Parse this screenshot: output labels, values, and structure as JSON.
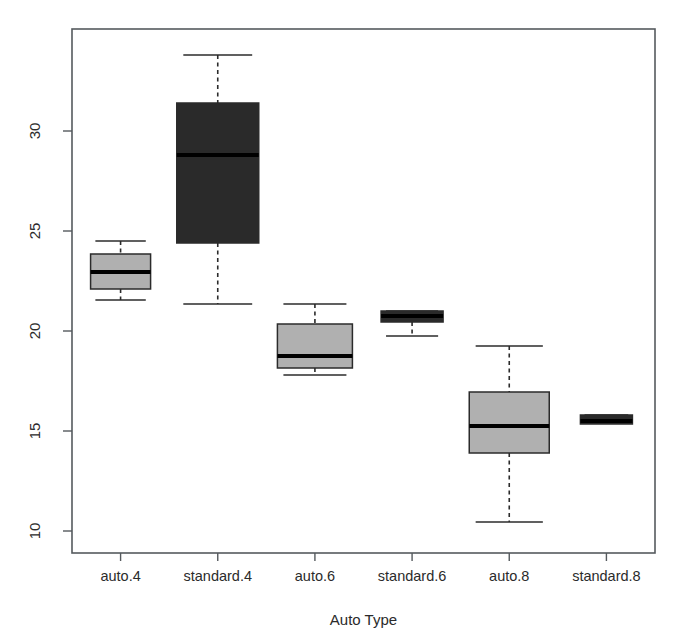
{
  "title": "",
  "axes": {
    "xlabel": "Auto Type",
    "ylabel": "",
    "ytick_labels": [
      "10",
      "15",
      "20",
      "25",
      "30"
    ],
    "xtick_labels": [
      "auto.4",
      "standard.4",
      "auto.6",
      "standard.6",
      "auto.8",
      "standard.8"
    ]
  },
  "colors": {
    "box_light": "#b0b0b0",
    "box_dark": "#2a2a2a",
    "border": "#2b2b2b",
    "frame": "#555a5e",
    "background": "#ffffff",
    "median": "#000000"
  },
  "chart_data": {
    "type": "box",
    "title": "",
    "xlabel": "Auto Type",
    "ylabel": "",
    "ylim": [
      8.9,
      35.1
    ],
    "yticks": [
      10,
      15,
      20,
      25,
      30
    ],
    "grid": false,
    "legend": "none",
    "categories": [
      "auto.4",
      "standard.4",
      "auto.6",
      "standard.6",
      "auto.8",
      "standard.8"
    ],
    "boxes": [
      {
        "label": "auto.4",
        "fill": "#b0b0b0",
        "whisker_low": 21.55,
        "q1": 22.1,
        "median": 22.95,
        "q3": 23.85,
        "whisker_high": 24.5,
        "outliers": []
      },
      {
        "label": "standard.4",
        "fill": "#2a2a2a",
        "whisker_low": 21.35,
        "q1": 24.4,
        "median": 28.8,
        "q3": 31.4,
        "whisker_high": 33.8,
        "outliers": []
      },
      {
        "label": "auto.6",
        "fill": "#b0b0b0",
        "whisker_low": 17.8,
        "q1": 18.15,
        "median": 18.75,
        "q3": 20.35,
        "whisker_high": 21.35,
        "outliers": []
      },
      {
        "label": "standard.6",
        "fill": "#2a2a2a",
        "whisker_low": 19.75,
        "q1": 20.45,
        "median": 20.75,
        "q3": 21.0,
        "whisker_high": 21.0,
        "outliers": []
      },
      {
        "label": "auto.8",
        "fill": "#b0b0b0",
        "whisker_low": 10.45,
        "q1": 13.9,
        "median": 15.25,
        "q3": 16.95,
        "whisker_high": 19.25,
        "outliers": []
      },
      {
        "label": "standard.8",
        "fill": "#2a2a2a",
        "whisker_low": 15.4,
        "q1": 15.35,
        "median": 15.5,
        "q3": 15.8,
        "whisker_high": 15.8,
        "outliers": []
      }
    ]
  }
}
